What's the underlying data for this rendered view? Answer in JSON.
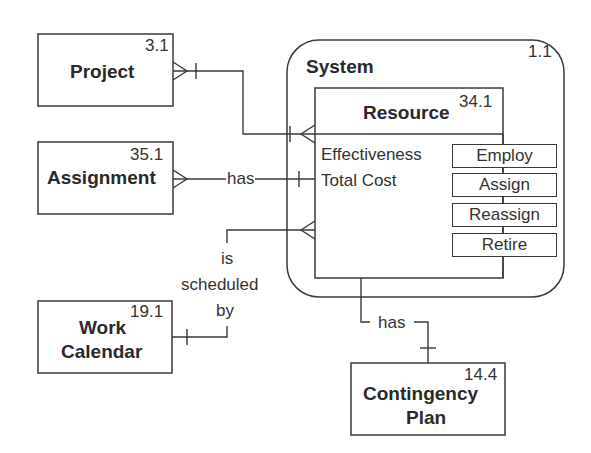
{
  "diagram": {
    "type": "entity-relationship",
    "container": {
      "name": "System",
      "id": "1.1"
    },
    "entities": [
      {
        "key": "project",
        "name": "Project",
        "id": "3.1"
      },
      {
        "key": "assignment",
        "name": "Assignment",
        "id": "35.1"
      },
      {
        "key": "work_calendar",
        "name_line1": "Work",
        "name_line2": "Calendar",
        "id": "19.1"
      },
      {
        "key": "resource",
        "name": "Resource",
        "id": "34.1",
        "attributes": [
          "Effectiveness",
          "Total Cost"
        ],
        "operations": [
          "Employ",
          "Assign",
          "Reassign",
          "Retire"
        ]
      },
      {
        "key": "contingency_plan",
        "name_line1": "Contingency",
        "name_line2": "Plan",
        "id": "14.4"
      }
    ],
    "relationships": [
      {
        "from": "Project",
        "to": "Resource",
        "label": ""
      },
      {
        "from": "Assignment",
        "to": "Resource",
        "label": "has"
      },
      {
        "from": "Resource",
        "to": "Work Calendar",
        "label_lines": [
          "is",
          "scheduled",
          "by"
        ]
      },
      {
        "from": "Resource",
        "to": "Contingency Plan",
        "label": "has"
      }
    ]
  }
}
